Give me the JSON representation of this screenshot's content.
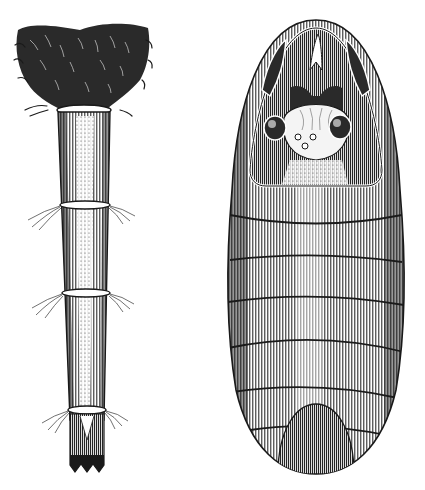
{
  "image": {
    "width": 425,
    "height": 490,
    "style": "black-and-white engraving",
    "background": "#ffffff",
    "ink": "#1a1a1a"
  },
  "figures": [
    {
      "name": "larval-case",
      "description": "Long tapering tubular case with a dense tuft of hairs at the top, three ring bands with fine bristles, and a pointed serrated tip at the bottom",
      "bounds": {
        "x": 15,
        "y": 20,
        "w": 135,
        "h": 455
      },
      "rings": 3
    },
    {
      "name": "pupa",
      "description": "Oval segmented pupa viewed from the ventral side; the head area has large compound eyes and three small ocelli, inside a pointed head shield; the abdomen shows 6 visible segments",
      "bounds": {
        "x": 228,
        "y": 18,
        "w": 180,
        "h": 455
      },
      "segments": 6
    }
  ]
}
